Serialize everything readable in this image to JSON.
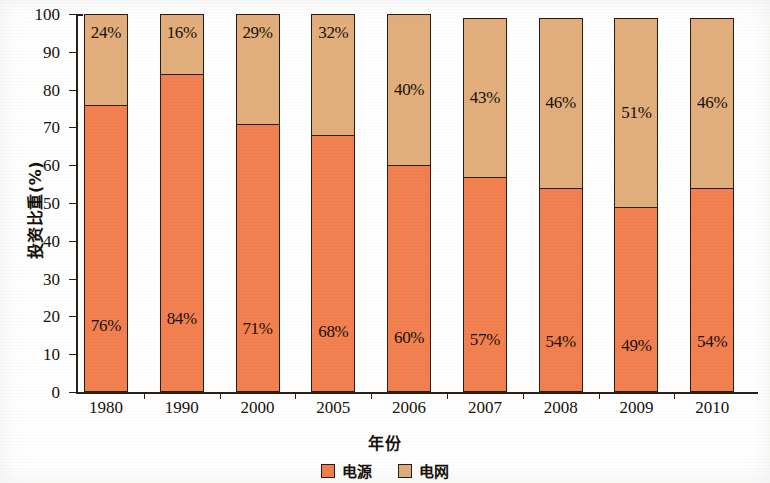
{
  "chart_data": {
    "type": "bar",
    "subtype": "stacked-bar-100",
    "title": "",
    "xlabel": "年份",
    "ylabel": "投资比重(%)",
    "ylim": [
      0,
      100
    ],
    "ytick_step": 10,
    "yticks": [
      0,
      10,
      20,
      30,
      40,
      50,
      60,
      70,
      80,
      90,
      100
    ],
    "ytick_labels": [
      "0",
      "10",
      "20",
      "30",
      "40",
      "50",
      "60",
      "70",
      "80",
      "90",
      "100"
    ],
    "grid": false,
    "legend_position": "bottom-center",
    "categories": [
      "1980",
      "1990",
      "2000",
      "2005",
      "2006",
      "2007",
      "2008",
      "2009",
      "2010"
    ],
    "series": [
      {
        "name": "电源",
        "color": "#f28050",
        "values": [
          76,
          84,
          71,
          68,
          60,
          57,
          54,
          49,
          54
        ],
        "labels": [
          "76%",
          "84%",
          "71%",
          "68%",
          "60%",
          "57%",
          "54%",
          "49%",
          "54%"
        ]
      },
      {
        "name": "电网",
        "color": "#e2ae7c",
        "values": [
          24,
          16,
          29,
          32,
          40,
          43,
          46,
          51,
          46
        ],
        "labels": [
          "24%",
          "16%",
          "29%",
          "32%",
          "40%",
          "43%",
          "46%",
          "51%",
          "46%"
        ]
      }
    ],
    "bar_totals": [
      100,
      100,
      100,
      100,
      100,
      99,
      99,
      99,
      99
    ],
    "axis_color": "#2a2018",
    "bar_outline_color": "#2a1c10"
  },
  "legend": {
    "items": [
      {
        "label": "电源",
        "color": "#f28050"
      },
      {
        "label": "电网",
        "color": "#e2ae7c"
      }
    ]
  }
}
